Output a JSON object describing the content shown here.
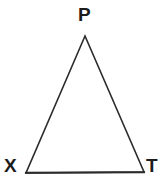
{
  "figure": {
    "type": "triangle-diagram",
    "shape_name": "triangle",
    "background_color": "#ffffff",
    "stroke_color": "#2b2b2b",
    "stroke_width": 1.6,
    "fill": "none",
    "label_color": "#1c1c1c",
    "vertices": [
      {
        "id": "P",
        "label": "P",
        "x": 85,
        "y": 36,
        "position": "apex-top"
      },
      {
        "id": "X",
        "label": "X",
        "x": 26,
        "y": 173,
        "position": "bottom-left"
      },
      {
        "id": "T",
        "label": "T",
        "x": 144,
        "y": 172,
        "position": "bottom-right"
      }
    ],
    "edges": [
      {
        "id": "XP",
        "from": "X",
        "to": "P"
      },
      {
        "id": "PT",
        "from": "P",
        "to": "T"
      },
      {
        "id": "XT",
        "from": "X",
        "to": "T"
      }
    ],
    "labels": {
      "apex": "P",
      "bottom_left": "X",
      "bottom_right": "T"
    }
  }
}
